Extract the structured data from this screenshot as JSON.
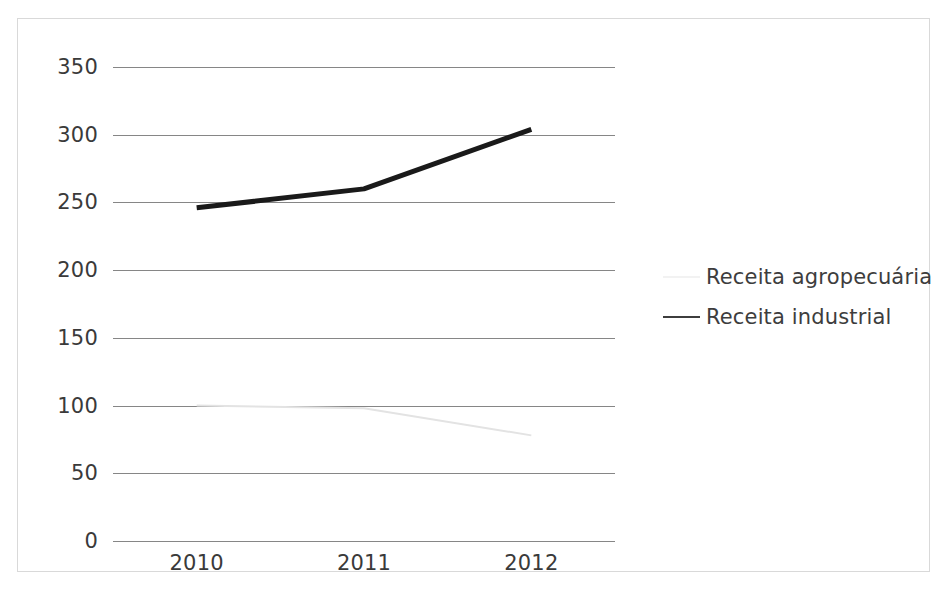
{
  "chart_data": {
    "type": "line",
    "title": "",
    "subtitle": "",
    "xlabel": "",
    "ylabel": "",
    "categories": [
      "2010",
      "2011",
      "2012"
    ],
    "x": [
      2010,
      2011,
      2012
    ],
    "ylim": [
      0,
      350
    ],
    "ytick_values": [
      350,
      300,
      250,
      200,
      150,
      100,
      50,
      0
    ],
    "ytick_labels": [
      "350",
      "300",
      "250",
      "200",
      "150",
      "100",
      "50",
      "0"
    ],
    "xtick_labels": [
      "2010",
      "2011",
      "2012"
    ],
    "grid": "horizontal",
    "legend_position": "right",
    "series": [
      {
        "name": "Receita agropecuária",
        "values": [
          100,
          98,
          78
        ],
        "color": "#e3e3e3",
        "line_width": 2
      },
      {
        "name": "Receita industrial",
        "values": [
          246,
          260,
          304
        ],
        "color": "#1a1a1a",
        "line_width": 5
      }
    ]
  },
  "legend": {
    "items": [
      {
        "label": "Receita agropecuária",
        "swatch_color": "#f2f2f2"
      },
      {
        "label": "Receita industrial",
        "swatch_color": "#3d3d3d"
      }
    ]
  },
  "axis": {
    "y_labels": [
      "350",
      "300",
      "250",
      "200",
      "150",
      "100",
      "50",
      "0"
    ],
    "x_labels": [
      "2010",
      "2011",
      "2012"
    ]
  },
  "colors": {
    "gridline": "#868686",
    "frame": "#d9d9d9",
    "text": "#3a3a3a",
    "series_dark": "#1a1a1a",
    "series_light": "#e3e3e3",
    "background": "#ffffff"
  }
}
